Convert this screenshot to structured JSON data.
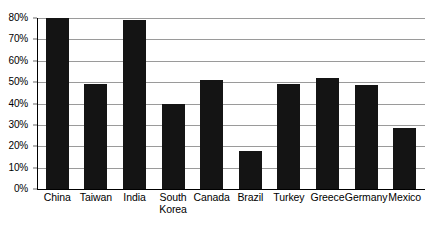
{
  "chart_data": {
    "type": "bar",
    "title": "",
    "subtitle": "",
    "xlabel": "",
    "ylabel": "",
    "ylim": [
      0,
      80
    ],
    "grid": true,
    "legend": false,
    "legend_position": "none",
    "orientation": "vertical",
    "bar_color": "#141414",
    "gridline_color": "#9a9a9a",
    "axis_color": "#000000",
    "background_color": "#ffffff",
    "y_ticks": [
      {
        "value": 0,
        "label": "0%"
      },
      {
        "value": 10,
        "label": "10%"
      },
      {
        "value": 20,
        "label": "20%"
      },
      {
        "value": 30,
        "label": "30%"
      },
      {
        "value": 40,
        "label": "40%"
      },
      {
        "value": 50,
        "label": "50%"
      },
      {
        "value": 60,
        "label": "60%"
      },
      {
        "value": 70,
        "label": "70%"
      },
      {
        "value": 80,
        "label": "80%"
      }
    ],
    "categories": [
      "China",
      "Taiwan",
      "India",
      "South\nKorea",
      "Canada",
      "Brazil",
      "Turkey",
      "Greece",
      "Germany",
      "Mexico"
    ],
    "values": [
      80,
      49,
      79,
      40,
      51,
      18,
      49,
      52,
      48.5,
      28.5
    ]
  }
}
